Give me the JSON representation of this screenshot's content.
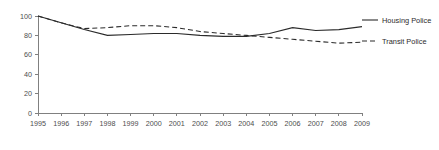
{
  "chart_data": {
    "type": "line",
    "title": "",
    "subtitle": "",
    "xlabel": "",
    "ylabel": "",
    "grid": false,
    "legend_position": "right",
    "x": [
      1995,
      1996,
      1997,
      1998,
      1999,
      2000,
      2001,
      2002,
      2003,
      2004,
      2005,
      2006,
      2007,
      2008,
      2009
    ],
    "categories": [
      "1995",
      "1996",
      "1997",
      "1998",
      "1999",
      "2000",
      "2001",
      "2002",
      "2003",
      "2004",
      "2005",
      "2006",
      "2007",
      "2008",
      "2009"
    ],
    "xlim": [
      1995,
      2009
    ],
    "ylim": [
      0,
      100
    ],
    "yticks": [
      0,
      20,
      40,
      60,
      80,
      100
    ],
    "ytick_labels": [
      "0",
      "20",
      "40",
      "60",
      "80",
      "100"
    ],
    "series": [
      {
        "name": "Housing Police",
        "style": "solid",
        "color": "#2b2b2b",
        "values": [
          100,
          93,
          86,
          80,
          81,
          82,
          82,
          80,
          79,
          79,
          82,
          88,
          85,
          86,
          89
        ]
      },
      {
        "name": "Transit Police",
        "style": "dashed",
        "color": "#2b2b2b",
        "values": [
          100,
          93,
          87,
          88,
          90,
          90,
          88,
          84,
          82,
          80,
          78,
          76,
          74,
          72,
          73
        ]
      }
    ]
  },
  "legend": {
    "items": [
      {
        "label": "Housing Police",
        "style": "solid"
      },
      {
        "label": "Transit Police",
        "style": "dashed"
      }
    ]
  }
}
